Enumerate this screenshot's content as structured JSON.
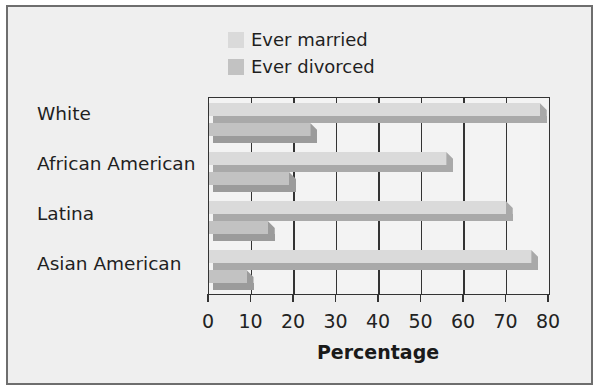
{
  "chart_data": {
    "type": "bar",
    "orientation": "horizontal",
    "title": "",
    "xlabel": "Percentage",
    "ylabel": "",
    "xlim": [
      0,
      80
    ],
    "x_ticks": [
      "0",
      "10",
      "20",
      "30",
      "40",
      "50",
      "60",
      "70",
      "80"
    ],
    "grid": true,
    "legend_position": "top",
    "categories": [
      "White",
      "African American",
      "Latina",
      "Asian American"
    ],
    "series": [
      {
        "name": "Ever married",
        "values": [
          79,
          57,
          71,
          77
        ],
        "color": "#dadada"
      },
      {
        "name": "Ever divorced",
        "values": [
          25,
          20,
          15,
          10
        ],
        "color": "#c2c2c2"
      }
    ]
  },
  "legend": {
    "items": [
      {
        "label": "Ever married",
        "color": "#dadada"
      },
      {
        "label": "Ever divorced",
        "color": "#c2c2c2"
      }
    ]
  },
  "axis": {
    "xlabel": "Percentage",
    "ticks": [
      "0",
      "10",
      "20",
      "30",
      "40",
      "50",
      "60",
      "70",
      "80"
    ]
  },
  "categories": [
    {
      "label": "White"
    },
    {
      "label": "African American"
    },
    {
      "label": "Latina"
    },
    {
      "label": "Asian American"
    }
  ]
}
